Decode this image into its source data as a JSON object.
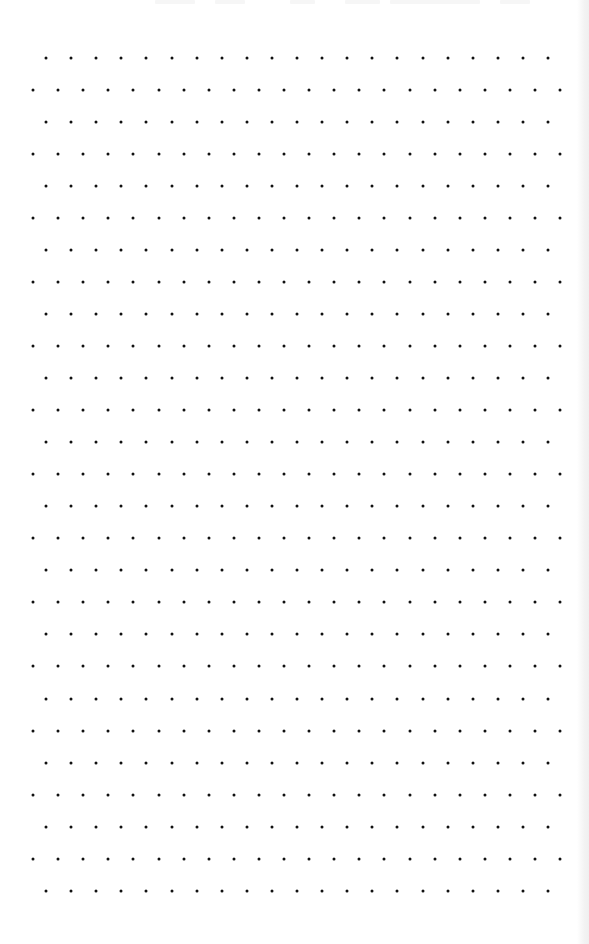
{
  "page": {
    "type": "dot-grid",
    "background_color": "#ffffff",
    "dot_color": "#111111",
    "dot_size_px": 3
  },
  "grid": {
    "rows": 27,
    "row_start_y": 57.5,
    "row_spacing_y": 32.05,
    "col_spacing_x": 25.1,
    "inset_row_start_x": 46,
    "inset_row_count": 21,
    "outset_row_start_x": 33,
    "outset_row_count": 22,
    "first_row_is_inset": true
  }
}
